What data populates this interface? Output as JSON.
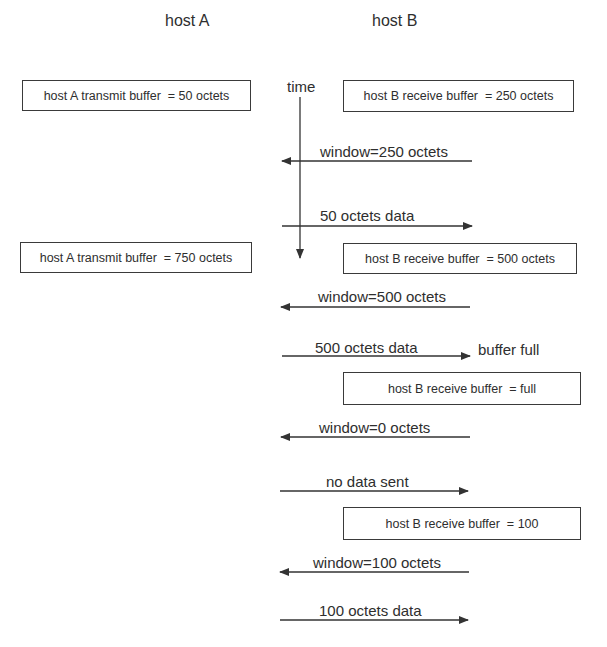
{
  "diagram": {
    "hosts": {
      "a": {
        "title": "host A"
      },
      "b": {
        "title": "host B"
      }
    },
    "time_axis": {
      "label": "time"
    },
    "buffers": [
      {
        "side": "A",
        "text": "host A transmit buffer  = 50 octets"
      },
      {
        "side": "B",
        "text": "host B receive buffer  = 250 octets"
      },
      {
        "side": "A",
        "text": "host A transmit buffer  = 750 octets"
      },
      {
        "side": "B",
        "text": "host B receive buffer  = 500 octets"
      },
      {
        "side": "B",
        "text": "host B receive buffer  = full"
      },
      {
        "side": "B",
        "text": "host B receive buffer  = 100"
      }
    ],
    "messages": [
      {
        "direction": "B_to_A",
        "label": "window=250 octets"
      },
      {
        "direction": "A_to_B",
        "label": "50 octets data"
      },
      {
        "direction": "B_to_A",
        "label": "window=500 octets"
      },
      {
        "direction": "A_to_B",
        "label": "500 octets data"
      },
      {
        "direction": "B_to_A",
        "label": "window=0 octets"
      },
      {
        "direction": "A_to_B",
        "label": "no data sent"
      },
      {
        "direction": "B_to_A",
        "label": "window=100 octets"
      },
      {
        "direction": "A_to_B",
        "label": "100 octets data"
      }
    ],
    "notes": {
      "buffer_full": "buffer full"
    },
    "colors": {
      "line": "#333333",
      "text": "#2e2e2e",
      "background": "#ffffff"
    }
  }
}
